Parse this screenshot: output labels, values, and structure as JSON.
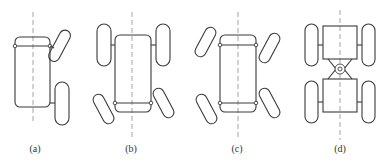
{
  "figure": {
    "type": "vehicle steering configuration diagrams",
    "panels": [
      {
        "id": "a",
        "label": "(a)",
        "description": "front-wheel steering, single side view, front wheel turned"
      },
      {
        "id": "b",
        "label": "(b)",
        "description": "rear-wheel steering, rear wheels turned"
      },
      {
        "id": "c",
        "label": "(c)",
        "description": "four-wheel steering, all wheels turned"
      },
      {
        "id": "d",
        "label": "(d)",
        "description": "articulated steering, central pivot joint"
      }
    ]
  },
  "colors": {
    "outline": "#3a3a3a",
    "centerline": "#9a9a9a",
    "background": "#ffffff"
  }
}
